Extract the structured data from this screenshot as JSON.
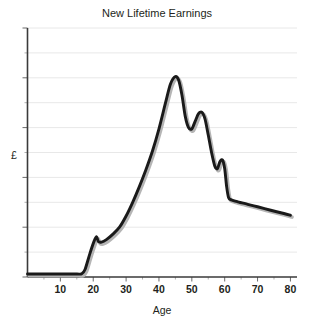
{
  "chart_data": {
    "type": "line",
    "title": "New Lifetime Earnings",
    "xlabel": "Age",
    "ylabel": "£",
    "xlim": [
      0,
      82
    ],
    "ylim": [
      0,
      10
    ],
    "grid": true,
    "legend": null,
    "xticks": [
      10,
      20,
      30,
      40,
      50,
      60,
      70,
      80
    ],
    "xtick_labels": [
      "10",
      "20",
      "30",
      "40",
      "50",
      "60",
      "70",
      "80"
    ],
    "yticks": [
      0,
      1,
      2,
      3,
      4,
      5,
      6,
      7,
      8,
      9,
      10
    ],
    "ytick_labels": [
      "",
      "",
      "",
      "",
      "",
      "",
      "",
      "",
      "",
      "",
      ""
    ],
    "series": [
      {
        "name": "New Lifetime Earnings",
        "color": "#1a1a1a",
        "shadow_color": "#b5b5b5",
        "x": [
          0,
          5,
          10,
          15,
          16.5,
          17.5,
          19,
          20.3,
          21,
          21.6,
          22.5,
          24,
          26,
          28,
          30,
          32,
          34,
          36,
          38,
          40,
          42,
          43.5,
          45,
          46,
          47,
          48,
          49,
          50,
          51,
          52,
          53,
          54,
          55,
          56,
          57,
          57.8,
          58.5,
          59.3,
          60,
          60.6,
          61.2,
          62,
          64,
          67,
          70,
          74,
          78,
          80
        ],
        "y": [
          0.12,
          0.12,
          0.12,
          0.12,
          0.13,
          0.3,
          0.95,
          1.45,
          1.62,
          1.42,
          1.4,
          1.5,
          1.72,
          2.0,
          2.45,
          3.0,
          3.62,
          4.3,
          5.05,
          5.95,
          7.0,
          7.75,
          8.05,
          7.9,
          7.3,
          6.45,
          6.0,
          5.95,
          6.25,
          6.55,
          6.62,
          6.35,
          5.7,
          5.0,
          4.45,
          4.35,
          4.62,
          4.7,
          4.35,
          3.62,
          3.18,
          3.1,
          3.02,
          2.92,
          2.82,
          2.68,
          2.55,
          2.48
        ]
      }
    ],
    "annotations": []
  },
  "figure": {
    "background": "#ffffff",
    "gridline_color": "#e8e8e8",
    "axis_color": "#3a3a3a",
    "text_color": "#231f20"
  }
}
